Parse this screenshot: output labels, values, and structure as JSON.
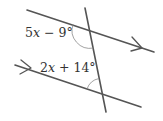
{
  "diagram": {
    "colors": {
      "line": "#555555",
      "arc": "#8a8a8a",
      "text": "#333333",
      "background": "#ffffff"
    },
    "angles": [
      {
        "id": "top",
        "coefficient": "5",
        "variable": "x",
        "operator": " − ",
        "constant": "9°",
        "text": "5x − 9°"
      },
      {
        "id": "bottom",
        "coefficient": "2",
        "variable": "x",
        "operator": " + ",
        "constant": "14°",
        "text": "2x + 14°"
      }
    ],
    "parallel_markers": [
      "arrow",
      "arrow"
    ]
  }
}
